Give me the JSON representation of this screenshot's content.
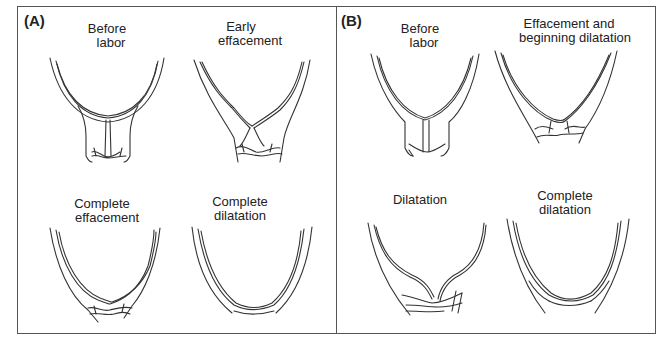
{
  "figure": {
    "panels": [
      {
        "label": "(A)",
        "stages": [
          {
            "caption_line1": "Before",
            "caption_line2": "labor"
          },
          {
            "caption_line1": "Early",
            "caption_line2": "effacement"
          },
          {
            "caption_line1": "Complete",
            "caption_line2": "effacement"
          },
          {
            "caption_line1": "Complete",
            "caption_line2": "dilatation"
          }
        ]
      },
      {
        "label": "(B)",
        "stages": [
          {
            "caption_line1": "Before",
            "caption_line2": "labor"
          },
          {
            "caption_line1": "Effacement and",
            "caption_line2": "beginning dilatation"
          },
          {
            "caption_line1": "Dilatation",
            "caption_line2": ""
          },
          {
            "caption_line1": "Complete",
            "caption_line2": "dilatation"
          }
        ]
      }
    ],
    "colors": {
      "line": "#333333",
      "border": "#555555",
      "background": "#ffffff"
    }
  }
}
